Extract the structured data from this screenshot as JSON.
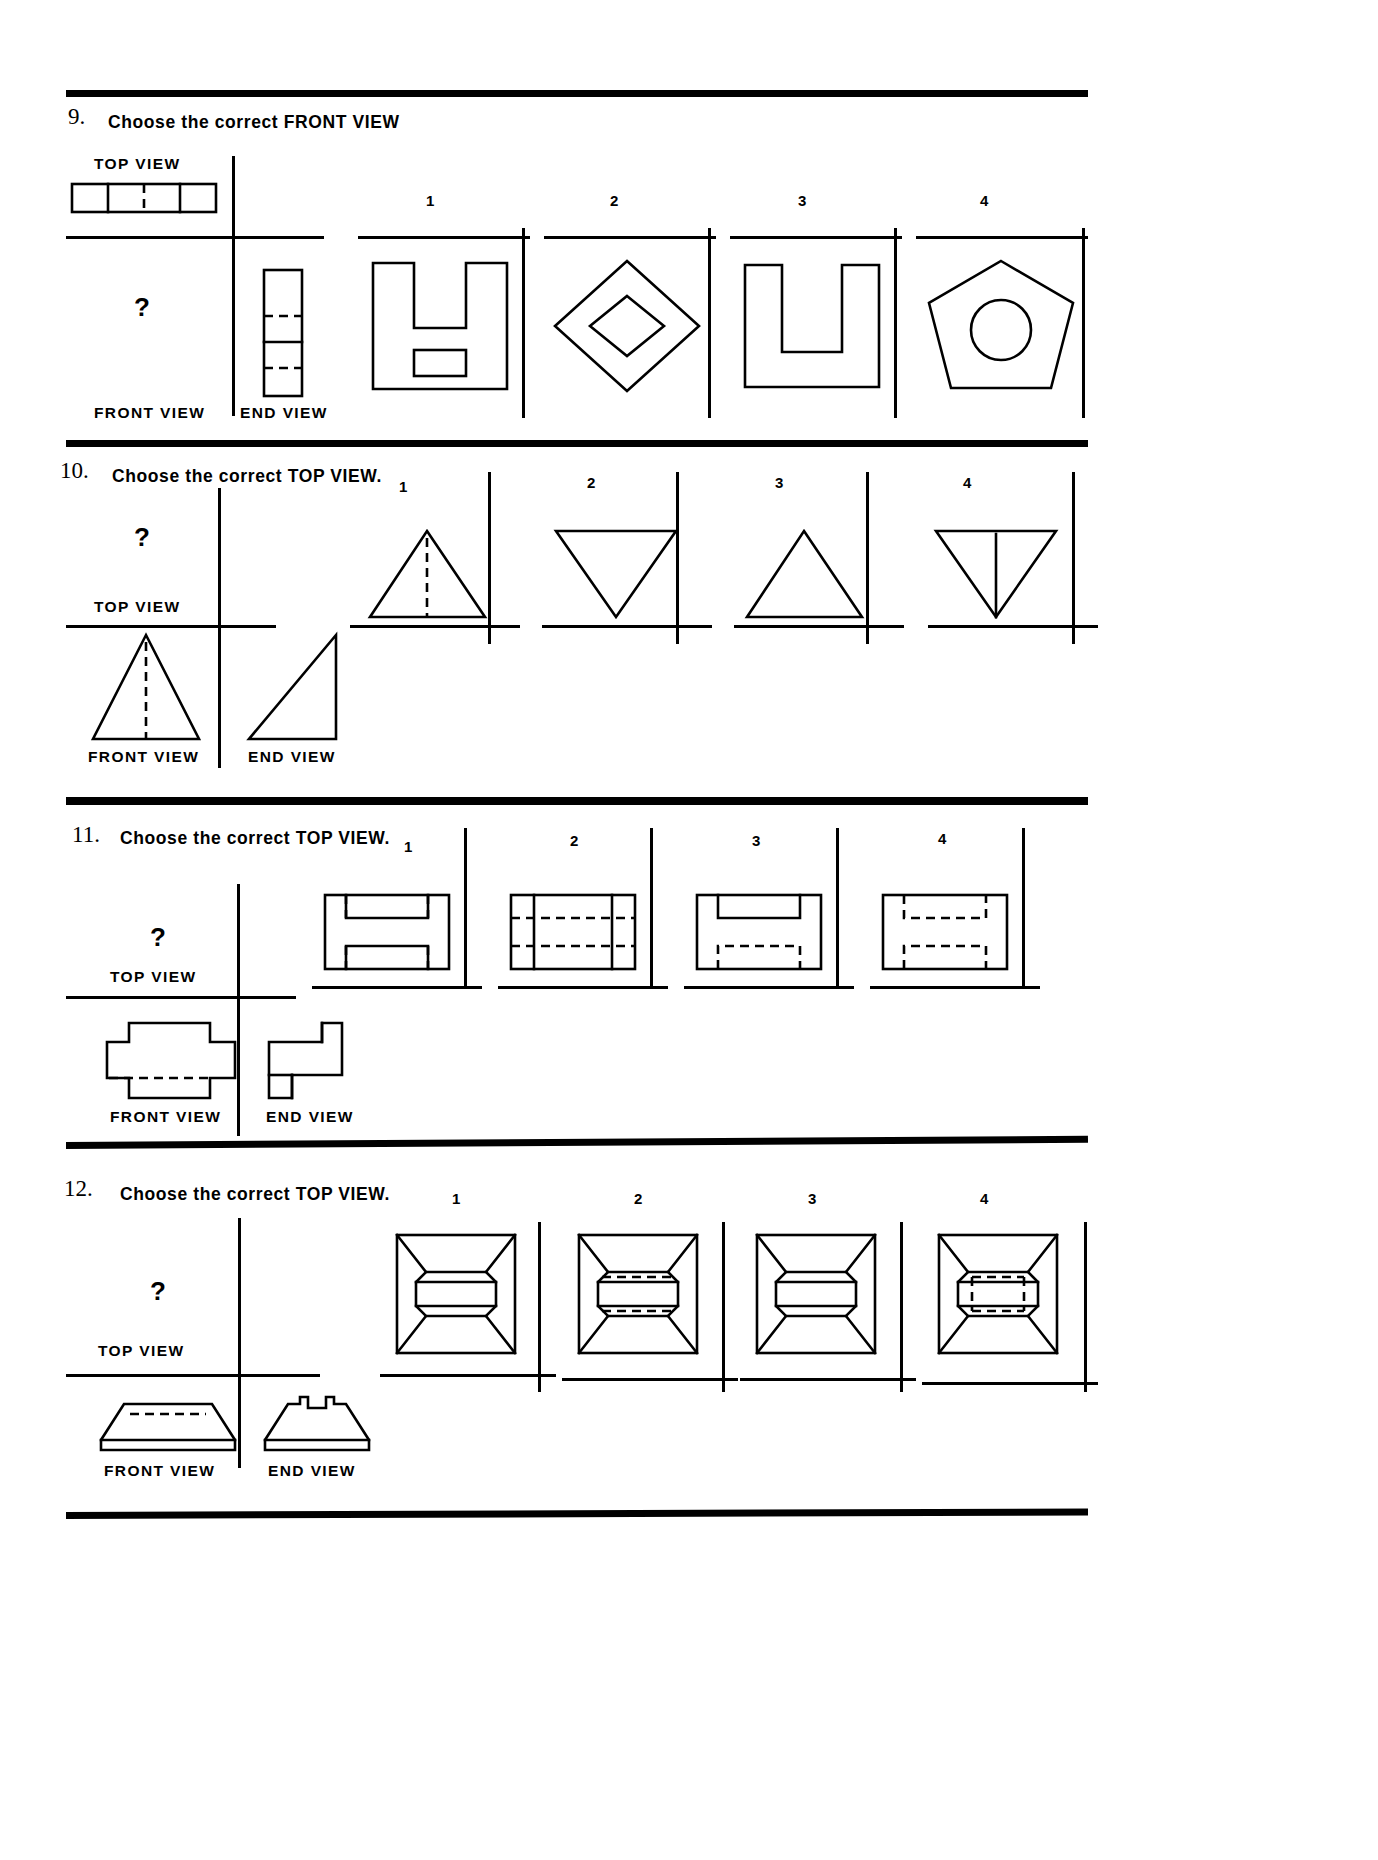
{
  "page": {
    "kind": "orthographic-projection-test-worksheet",
    "option_numbers": [
      "1",
      "2",
      "3",
      "4"
    ],
    "unknown_marker": "?"
  },
  "labels": {
    "top_view": "TOP VIEW",
    "front_view": "FRONT VIEW",
    "end_view": "END VIEW"
  },
  "questions": [
    {
      "number": "9.",
      "prompt": "Choose the correct FRONT VIEW",
      "given_views": [
        "TOP VIEW",
        "END VIEW"
      ],
      "missing_view": "FRONT VIEW",
      "given_label_top": "TOP VIEW",
      "given_label_front": "FRONT VIEW",
      "given_label_end": "END VIEW",
      "options": [
        {
          "num": "1",
          "shape": "u-channel-with-inner-rectangle"
        },
        {
          "num": "2",
          "shape": "diamond-with-inner-diamond"
        },
        {
          "num": "3",
          "shape": "stepped-u-bracket"
        },
        {
          "num": "4",
          "shape": "pentagon-with-inner-circle"
        }
      ]
    },
    {
      "number": "10.",
      "prompt": "Choose the correct TOP VIEW.",
      "given_views": [
        "FRONT VIEW",
        "END VIEW"
      ],
      "missing_view": "TOP VIEW",
      "given_label_top": "TOP VIEW",
      "given_label_front": "FRONT VIEW",
      "given_label_end": "END VIEW",
      "options": [
        {
          "num": "1",
          "shape": "triangle-up-with-dashed-centerline"
        },
        {
          "num": "2",
          "shape": "triangle-down-plain"
        },
        {
          "num": "3",
          "shape": "triangle-up-plain"
        },
        {
          "num": "4",
          "shape": "triangle-down-with-solid-centerline"
        }
      ]
    },
    {
      "number": "11.",
      "prompt": "Choose the correct TOP VIEW.",
      "given_views": [
        "FRONT VIEW",
        "END VIEW"
      ],
      "missing_view": "TOP VIEW",
      "given_label_top": "TOP VIEW",
      "given_label_front": "FRONT VIEW",
      "given_label_end": "END VIEW",
      "options": [
        {
          "num": "1",
          "shape": "rectangle-two-solid-slots-dashed-ends"
        },
        {
          "num": "2",
          "shape": "rectangle-two-full-dashed-lines-vertical-dividers"
        },
        {
          "num": "3",
          "shape": "rectangle-solid-top-notch-dashed-bottom-notch"
        },
        {
          "num": "4",
          "shape": "rectangle-two-dashed-notches"
        }
      ]
    },
    {
      "number": "12.",
      "prompt": "Choose the correct TOP VIEW.",
      "given_views": [
        "FRONT VIEW",
        "END VIEW"
      ],
      "missing_view": "TOP VIEW",
      "given_label_top": "TOP VIEW",
      "given_label_front": "FRONT VIEW",
      "given_label_end": "END VIEW",
      "options": [
        {
          "num": "1",
          "shape": "square-frustum-with-solid-barrel-center"
        },
        {
          "num": "2",
          "shape": "square-frustum-with-dashed-slot-bowtie"
        },
        {
          "num": "3",
          "shape": "square-frustum-with-solid-bowtie"
        },
        {
          "num": "4",
          "shape": "square-frustum-with-dashed-rectangle-bowtie"
        }
      ]
    }
  ]
}
